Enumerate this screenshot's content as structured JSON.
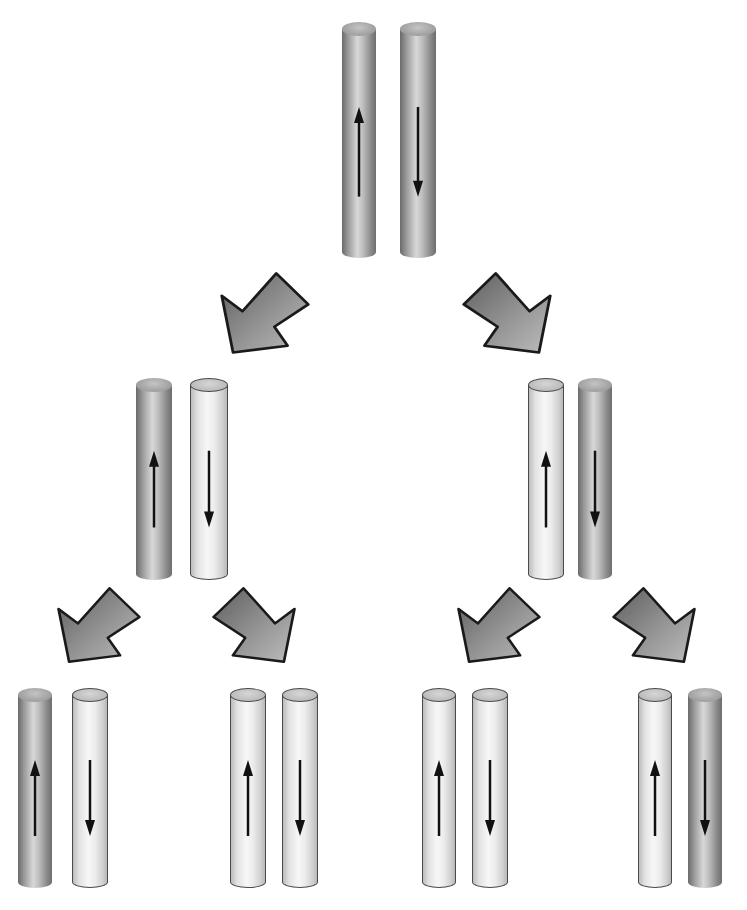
{
  "diagram": {
    "title": "",
    "colors": {
      "parental_strand": "#9a9a9a",
      "new_strand": "#eeeeee",
      "arrow_fill": "#8a8a8a",
      "outline": "#1a1a1a",
      "background": "#ffffff"
    },
    "generations": [
      {
        "name": "generation-0",
        "duplexes": [
          {
            "strands": [
              {
                "type": "dark",
                "direction": "up",
                "x": 342,
                "y": 22,
                "w": 34,
                "h": 236
              },
              {
                "type": "dark",
                "direction": "down",
                "x": 400,
                "y": 22,
                "w": 36,
                "h": 236
              }
            ]
          }
        ]
      },
      {
        "name": "generation-1",
        "duplexes": [
          {
            "strands": [
              {
                "type": "dark",
                "direction": "up",
                "x": 136,
                "y": 378,
                "w": 36,
                "h": 202
              },
              {
                "type": "light",
                "direction": "down",
                "x": 190,
                "y": 378,
                "w": 38,
                "h": 202
              }
            ]
          },
          {
            "strands": [
              {
                "type": "light",
                "direction": "up",
                "x": 528,
                "y": 378,
                "w": 36,
                "h": 202
              },
              {
                "type": "dark",
                "direction": "down",
                "x": 578,
                "y": 378,
                "w": 34,
                "h": 202
              }
            ]
          }
        ]
      },
      {
        "name": "generation-2",
        "duplexes": [
          {
            "strands": [
              {
                "type": "dark",
                "direction": "up",
                "x": 18,
                "y": 688,
                "w": 34,
                "h": 200
              },
              {
                "type": "light",
                "direction": "down",
                "x": 72,
                "y": 688,
                "w": 36,
                "h": 200
              }
            ]
          },
          {
            "strands": [
              {
                "type": "light",
                "direction": "up",
                "x": 230,
                "y": 688,
                "w": 36,
                "h": 200
              },
              {
                "type": "light",
                "direction": "down",
                "x": 282,
                "y": 688,
                "w": 36,
                "h": 200
              }
            ]
          },
          {
            "strands": [
              {
                "type": "light",
                "direction": "up",
                "x": 422,
                "y": 688,
                "w": 34,
                "h": 200
              },
              {
                "type": "light",
                "direction": "down",
                "x": 472,
                "y": 688,
                "w": 36,
                "h": 200
              }
            ]
          },
          {
            "strands": [
              {
                "type": "light",
                "direction": "up",
                "x": 638,
                "y": 688,
                "w": 34,
                "h": 200
              },
              {
                "type": "dark",
                "direction": "down",
                "x": 688,
                "y": 688,
                "w": 34,
                "h": 200
              }
            ]
          }
        ]
      }
    ],
    "transition_arrows": [
      {
        "direction": "down-left",
        "x": 218,
        "y": 270,
        "w": 94,
        "h": 86
      },
      {
        "direction": "down-right",
        "x": 460,
        "y": 270,
        "w": 94,
        "h": 86
      },
      {
        "direction": "down-left",
        "x": 55,
        "y": 585,
        "w": 88,
        "h": 80
      },
      {
        "direction": "down-right",
        "x": 210,
        "y": 585,
        "w": 88,
        "h": 80
      },
      {
        "direction": "down-left",
        "x": 455,
        "y": 585,
        "w": 88,
        "h": 80
      },
      {
        "direction": "down-right",
        "x": 610,
        "y": 585,
        "w": 88,
        "h": 80
      }
    ]
  }
}
